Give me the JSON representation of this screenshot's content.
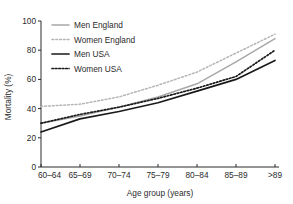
{
  "chart_data": {
    "type": "line",
    "title": "",
    "xlabel": "Age group (years)",
    "ylabel": "Mortality (%)",
    "categories": [
      "60–64",
      "65–69",
      "70–74",
      "75–79",
      "80–84",
      "85–89",
      ">89"
    ],
    "ylim": [
      0,
      100
    ],
    "yticks": [
      0,
      20,
      40,
      60,
      80,
      100
    ],
    "grid": false,
    "legend_position": "top-left",
    "series": [
      {
        "name": "Men England",
        "style": "solid",
        "color": "#a8a8a8",
        "width": 1.5,
        "values": [
          30,
          35,
          41,
          48,
          57,
          72,
          88
        ]
      },
      {
        "name": "Women England",
        "style": "dotted",
        "color": "#b5b5b5",
        "width": 1.5,
        "values": [
          41.5,
          43,
          48,
          56,
          65,
          78,
          91
        ]
      },
      {
        "name": "Men USA",
        "style": "solid",
        "color": "#1a1a1a",
        "width": 1.7,
        "values": [
          24,
          33,
          38,
          44,
          52,
          60,
          73
        ]
      },
      {
        "name": "Women USA",
        "style": "dotted",
        "color": "#1a1a1a",
        "width": 1.7,
        "values": [
          30,
          36,
          41,
          47,
          54,
          62,
          80
        ]
      }
    ]
  },
  "axis": {
    "y_tick_labels": [
      "100",
      "80",
      "60",
      "40",
      "20",
      "0"
    ],
    "x_tick_labels": [
      "60–64",
      "65–69",
      "70–74",
      "75–79",
      "80–84",
      "85–89",
      ">89"
    ],
    "y_title": "Mortality (%)",
    "x_title": "Age group (years)"
  },
  "legend": {
    "items": [
      {
        "label": "Men England"
      },
      {
        "label": "Women England"
      },
      {
        "label": "Men USA"
      },
      {
        "label": "Women USA"
      }
    ]
  },
  "colors": {
    "axis": "#2b2b2b",
    "england": "#a8a8a8",
    "usa": "#1a1a1a",
    "background": "#ffffff"
  }
}
